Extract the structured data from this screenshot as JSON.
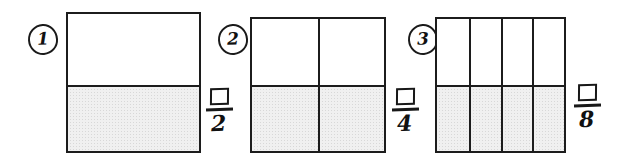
{
  "worksheet": {
    "title": "Fraction shading worksheet",
    "background_color": "#ffffff",
    "line_color": "#1c1c1c",
    "shade_color": "#f0f0f0"
  },
  "problems": [
    {
      "number": "1",
      "shape": "rectangle",
      "rows": 2,
      "columns": 1,
      "total_parts": 2,
      "shaded_parts": 1,
      "shaded_cells": [
        false,
        true
      ],
      "fraction": {
        "numerator": "",
        "numerator_type": "empty-answer-box",
        "denominator": "2"
      }
    },
    {
      "number": "2",
      "shape": "square",
      "rows": 2,
      "columns": 2,
      "total_parts": 4,
      "shaded_parts": 2,
      "shaded_cells": [
        false,
        false,
        true,
        true
      ],
      "fraction": {
        "numerator": "",
        "numerator_type": "empty-answer-box",
        "denominator": "4"
      }
    },
    {
      "number": "3",
      "shape": "square",
      "rows": 2,
      "columns": 4,
      "total_parts": 8,
      "shaded_parts": 4,
      "shaded_cells": [
        false,
        false,
        false,
        false,
        true,
        true,
        true,
        true
      ],
      "fraction": {
        "numerator": "",
        "numerator_type": "empty-answer-box",
        "denominator": "8"
      }
    }
  ]
}
